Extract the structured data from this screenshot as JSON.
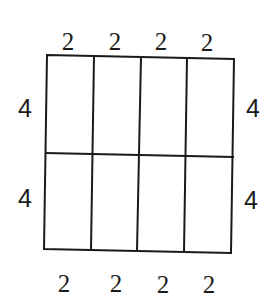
{
  "diagram": {
    "type": "area-model-rectangle",
    "rows": 2,
    "columns": 4,
    "top_labels": [
      "2",
      "2",
      "2",
      "2"
    ],
    "bottom_labels": [
      "2",
      "2",
      "2",
      "2"
    ],
    "left_labels": [
      "4",
      "4"
    ],
    "right_labels": [
      "4",
      "4"
    ],
    "line_color": "#1a1a1a",
    "background_color": "#ffffff"
  }
}
